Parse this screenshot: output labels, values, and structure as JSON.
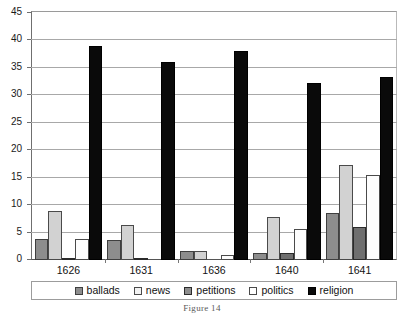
{
  "figure": {
    "caption": "Figure 14"
  },
  "legend": {
    "position": "bottom",
    "entries": [
      {
        "key": "ballads",
        "label": "ballads",
        "color": "#8d8d8d"
      },
      {
        "key": "news",
        "label": "news",
        "color": "#d2d2d2"
      },
      {
        "key": "petitions",
        "label": "petitions",
        "color": "#6f6f6f"
      },
      {
        "key": "politics",
        "label": "politics",
        "color": "#fdfdfd"
      },
      {
        "key": "religion",
        "label": "religion",
        "color": "#0a0a0a"
      }
    ]
  },
  "axes": {
    "y_ticks": [
      "0",
      "5",
      "10",
      "15",
      "20",
      "25",
      "30",
      "35",
      "40",
      "45"
    ],
    "x_ticks": [
      "1626",
      "1631",
      "1636",
      "1640",
      "1641"
    ]
  },
  "chart_data": {
    "type": "bar",
    "title": "",
    "xlabel": "",
    "ylabel": "",
    "ylim": [
      0,
      45
    ],
    "ytick_step": 5,
    "grid": true,
    "legend_position": "bottom",
    "categories": [
      "1626",
      "1631",
      "1636",
      "1640",
      "1641"
    ],
    "series": [
      {
        "name": "ballads",
        "color": "#8d8d8d",
        "values": [
          3.8,
          3.7,
          1.6,
          1.2,
          8.6
        ]
      },
      {
        "name": "news",
        "color": "#d2d2d2",
        "values": [
          8.9,
          6.3,
          1.6,
          7.8,
          17.3
        ]
      },
      {
        "name": "petitions",
        "color": "#6f6f6f",
        "values": [
          0.3,
          0.3,
          0.0,
          1.2,
          6.1
        ]
      },
      {
        "name": "politics",
        "color": "#fdfdfd",
        "values": [
          3.8,
          0.0,
          1.0,
          5.6,
          15.4
        ]
      },
      {
        "name": "religion",
        "color": "#0a0a0a",
        "values": [
          39.0,
          36.0,
          38.0,
          32.3,
          33.3
        ]
      }
    ]
  }
}
